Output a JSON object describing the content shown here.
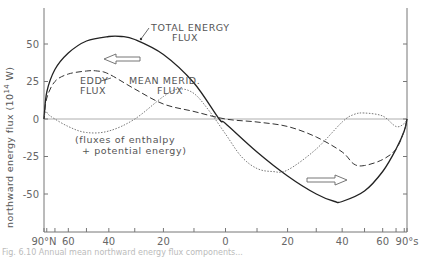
{
  "chart_data": {
    "type": "line",
    "title": "",
    "xlabel": "",
    "ylabel": "northward energy flux (10^14 W)",
    "ylabel_parts": {
      "main": "northward energy flux (10",
      "sup": "14",
      "unit": " W)"
    },
    "ylim": [
      -67,
      75
    ],
    "yticks": [
      50,
      25,
      0,
      -25,
      -50
    ],
    "ytick_labels": [
      "50",
      "25",
      "0",
      "-25",
      "-50"
    ],
    "x_scale": "sine of latitude (equal area), North on left",
    "xlim": [
      90,
      -90
    ],
    "xticks": [
      90,
      80,
      70,
      60,
      50,
      40,
      30,
      20,
      10,
      0,
      -10,
      -20,
      -30,
      -40,
      -50,
      -60,
      -70,
      -80,
      -90
    ],
    "xtick_labels": [
      {
        "lat": 90,
        "label": "90°N"
      },
      {
        "lat": 60,
        "label": "60"
      },
      {
        "lat": 40,
        "label": "40"
      },
      {
        "lat": 20,
        "label": "20"
      },
      {
        "lat": 0,
        "label": "0"
      },
      {
        "lat": -20,
        "label": "20"
      },
      {
        "lat": -40,
        "label": "40"
      },
      {
        "lat": -60,
        "label": "60"
      },
      {
        "lat": -90,
        "label": "90°s"
      }
    ],
    "grid": false,
    "zero_line": true,
    "series": [
      {
        "name": "TOTAL ENERGY FLUX",
        "style": "solid",
        "x": [
          90,
          80,
          70,
          60,
          50,
          40,
          35,
          30,
          20,
          10,
          2,
          0,
          -10,
          -20,
          -30,
          -37,
          -40,
          -50,
          -60,
          -70,
          -80,
          -90
        ],
        "values": [
          0,
          18,
          33,
          44,
          52,
          55,
          55,
          53,
          43,
          24,
          0,
          -3,
          -22,
          -38,
          -50,
          -55,
          -55,
          -48,
          -35,
          -20,
          -8,
          0
        ]
      },
      {
        "name": "EDDY FLUX",
        "style": "dashed",
        "x": [
          90,
          80,
          70,
          60,
          50,
          45,
          40,
          30,
          20,
          10,
          0,
          -10,
          -20,
          -30,
          -40,
          -45,
          -50,
          -60,
          -70,
          -80,
          -90
        ],
        "values": [
          0,
          14,
          25,
          30,
          32,
          32,
          30,
          20,
          10,
          5,
          0,
          -2,
          -5,
          -12,
          -22,
          -30,
          -31,
          -27,
          -20,
          -8,
          0
        ]
      },
      {
        "name": "MEAN MERID. FLUX",
        "style": "dotted",
        "x": [
          90,
          82,
          75,
          60,
          50,
          40,
          30,
          20,
          15,
          10,
          5,
          0,
          -5,
          -10,
          -15,
          -20,
          -30,
          -40,
          -45,
          -50,
          -60,
          -70,
          -80,
          -90
        ],
        "values": [
          0,
          5,
          2,
          -5,
          -9,
          -8,
          0,
          15,
          20,
          17,
          5,
          -10,
          -25,
          -33,
          -35,
          -34,
          -20,
          -2,
          3,
          4,
          2,
          -5,
          -3,
          0
        ]
      }
    ],
    "annotations": {
      "total_label": [
        "TOTAL  ENERGY",
        "FLUX"
      ],
      "eddy_label": [
        "EDDY",
        "FLUX"
      ],
      "mean_label": [
        "MEAN  MERID.",
        "FLUX"
      ],
      "note": [
        "(fluxes  of  enthalpy",
        "+  potential  energy)"
      ],
      "arrows": [
        {
          "direction": "left",
          "meaning": "northward flux in northern hemisphere"
        },
        {
          "direction": "right",
          "meaning": "southward flux in southern hemisphere"
        }
      ]
    },
    "legend": "none (direct curve labels)"
  },
  "caption": "Fig. 6.10  Annual mean northward energy flux components..."
}
